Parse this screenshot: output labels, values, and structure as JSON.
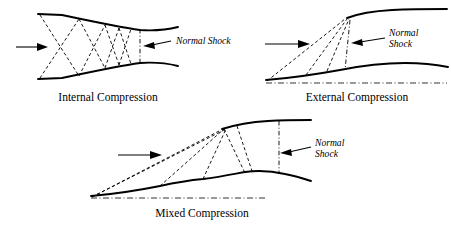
{
  "figure": {
    "background_color": "#ffffff",
    "line_color": "#000000",
    "panels": [
      {
        "id": "internal-compression",
        "caption": "Internal Compression",
        "shock_label": "Normal Shock",
        "shock_label_lines": [
          "Normal Shock"
        ],
        "flow_arrow": "leftward-inflow-arrow",
        "description": "Converging-diverging duct with crossing oblique shocks and a vertical normal shock at the throat exit"
      },
      {
        "id": "external-compression",
        "caption": "External Compression",
        "shock_label": "Normal Shock",
        "shock_label_lines": [
          "Normal",
          "Shock"
        ],
        "flow_arrow": "leftward-inflow-arrow",
        "description": "Ramp with two external oblique shocks focused on the cowl lip and a normal shock at the cowl lip"
      },
      {
        "id": "mixed-compression",
        "caption": "Mixed Compression",
        "shock_label": "Normal Shock",
        "shock_label_lines": [
          "Normal",
          "Shock"
        ],
        "flow_arrow": "leftward-inflow-arrow",
        "description": "External oblique shocks plus internal reflected shocks with the normal shock downstream in the duct"
      }
    ]
  }
}
